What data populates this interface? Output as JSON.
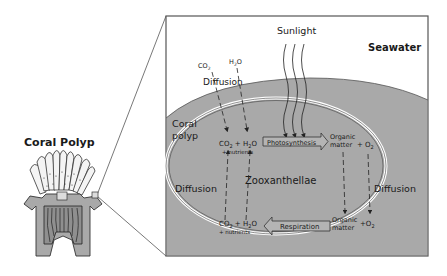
{
  "diagram": {
    "title_left": "Coral Polyp",
    "seawater_label": "Seawater",
    "sunlight_label": "Sunlight",
    "coral_polyp_label_line1": "Coral",
    "coral_polyp_label_line2": "polyp",
    "zooxanthellae_label": "Zooxanthellae",
    "diffusion_top": "Diffusion",
    "diffusion_left": "Diffusion",
    "diffusion_right": "Diffusion",
    "seawater_inputs": {
      "co2": "CO",
      "co2_sub": "2",
      "h2o_a": "H",
      "h2o_sub": "2",
      "h2o_b": "O"
    },
    "photosynthesis": {
      "label": "Photosynthesis",
      "inputs_a": "CO",
      "inputs_sub1": "2",
      "inputs_b": " + H",
      "inputs_sub2": "2",
      "inputs_c": "O",
      "inputs_line2": "+ nutrients",
      "output_line1": "Organic",
      "output_line2": "matter",
      "o2": "+ O",
      "o2_sub": "2"
    },
    "respiration": {
      "label": "Respiration",
      "output_a": "CO",
      "output_sub1": "2",
      "output_b": " + H",
      "output_sub2": "2",
      "output_c": "O",
      "output_line2": "+ nutrients",
      "input_line1": "Organic",
      "input_line2": "matter",
      "o2": "+O",
      "o2_sub": "2"
    },
    "colors": {
      "seawater": "#ffffff",
      "polyp_tissue": "#a9a9a9",
      "frame_border": "#555555",
      "text": "#1a1a1a"
    }
  }
}
